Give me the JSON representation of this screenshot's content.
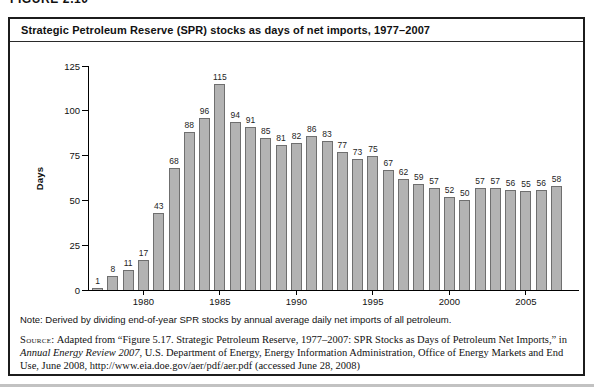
{
  "figure": {
    "cropped_label": "FIGURE 2.10",
    "title": "Strategic Petroleum Reserve (SPR) stocks as days of net imports, 1977–2007",
    "note": "Note: Derived by dividing end-of-year SPR stocks by annual average daily net imports of all petroleum.",
    "source": {
      "label": "Source:",
      "pre_italic": " Adapted from “Figure 5.17. Strategic Petroleum Reserve, 1977–2007: SPR Stocks as Days of Petroleum Net Imports,” in ",
      "italic": "Annual Energy Review 2007",
      "post_italic": ", U.S. Department of Energy, Energy Information Administration, Office of Energy Markets and End Use, June 2008, http://www.eia.doe.gov/aer/pdf/aer.pdf (accessed June 28, 2008)"
    }
  },
  "chart_data": {
    "type": "bar",
    "title": "Strategic Petroleum Reserve (SPR) stocks as days of net imports, 1977–2007",
    "xlabel": "",
    "ylabel": "Days",
    "ylim": [
      0,
      125
    ],
    "yticks": [
      0,
      25,
      50,
      75,
      100,
      125
    ],
    "grid": false,
    "legend": null,
    "value_labels_shown": true,
    "bar_color": "#b3b3b3",
    "bar_border_color": "#6f6f6f",
    "categories": [
      1977,
      1978,
      1979,
      1980,
      1981,
      1982,
      1983,
      1984,
      1985,
      1986,
      1987,
      1988,
      1989,
      1990,
      1991,
      1992,
      1993,
      1994,
      1995,
      1996,
      1997,
      1998,
      1999,
      2000,
      2001,
      2002,
      2003,
      2004,
      2005,
      2006,
      2007
    ],
    "values": [
      1,
      8,
      11,
      17,
      43,
      68,
      88,
      96,
      115,
      94,
      91,
      85,
      81,
      82,
      86,
      83,
      77,
      73,
      75,
      67,
      62,
      59,
      57,
      52,
      50,
      57,
      57,
      56,
      55,
      56,
      58
    ],
    "x_tick_labels": [
      "1980",
      "1985",
      "1990",
      "1995",
      "2000",
      "2005"
    ]
  }
}
